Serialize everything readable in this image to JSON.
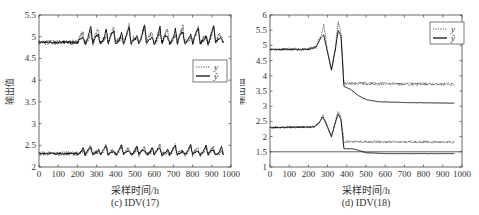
{
  "chart_data": [
    {
      "id": "c",
      "type": "line",
      "title": "",
      "caption": "(c) IDV(17)",
      "xlabel": "采样时间/h",
      "ylabel": "输出值",
      "xlim": [
        0,
        1000
      ],
      "ylim": [
        2,
        5.5
      ],
      "xticks": [
        0,
        100,
        200,
        300,
        400,
        500,
        600,
        700,
        800,
        900,
        1000
      ],
      "yticks": [
        2,
        2.5,
        3,
        3.5,
        4,
        4.5,
        5,
        5.5
      ],
      "ytick_labels": [
        "2",
        "2.5",
        "3",
        "3.5",
        "4",
        "4.5",
        "5",
        "5.5"
      ],
      "grid": false,
      "legend": {
        "position": "upper-right-inside",
        "entries": [
          "y",
          "ŷ"
        ]
      },
      "series": [
        {
          "name": "y",
          "style": "dotted",
          "group": "upper",
          "baseline": 4.87,
          "noise": 0.06,
          "description": "noisy around 4.85-4.9 for t<200, then periodic sawtooth spikes up to ~5.2-5.3 every ~40h until t≈960"
        },
        {
          "name": "ŷ",
          "style": "solid",
          "group": "upper",
          "baseline": 4.87,
          "noise": 0.03,
          "description": "tracks y with sawtooth peaks ~5.2"
        },
        {
          "name": "y",
          "style": "dotted",
          "group": "lower",
          "baseline": 2.31,
          "noise": 0.05,
          "description": "noisy around 2.3 for t<200, then periodic spikes up to ~2.5 every ~40h"
        },
        {
          "name": "ŷ",
          "style": "solid",
          "group": "lower",
          "baseline": 2.31,
          "noise": 0.02,
          "description": "tracks y with spikes ~2.5"
        }
      ],
      "spike_start": 200,
      "spike_period": 40,
      "t_end": 960,
      "upper_spike_peak": 5.22,
      "lower_spike_peak": 2.5
    },
    {
      "id": "d",
      "type": "line",
      "title": "",
      "caption": "(d) IDV(18)",
      "xlabel": "采样时间/h",
      "ylabel": "输出值",
      "xlim": [
        0,
        1000
      ],
      "ylim": [
        1,
        6
      ],
      "xticks": [
        0,
        100,
        200,
        300,
        400,
        500,
        600,
        700,
        800,
        900,
        1000
      ],
      "yticks": [
        1,
        1.5,
        2,
        2.5,
        3,
        3.5,
        4,
        4.5,
        5,
        5.5,
        6
      ],
      "ytick_labels": [
        "1",
        "1.5",
        "2",
        "2.5",
        "3",
        "3.5",
        "4",
        "4.5",
        "5",
        "5.5",
        "6"
      ],
      "grid": false,
      "legend": {
        "position": "upper-right-inside",
        "entries": [
          "y",
          "ŷ"
        ]
      },
      "reference_line": {
        "y": 1.5,
        "style": "solid-thin"
      },
      "series": [
        {
          "name": "y",
          "style": "dotted",
          "group": "upper",
          "points": [
            [
              0,
              4.87
            ],
            [
              200,
              4.87
            ],
            [
              240,
              4.95
            ],
            [
              265,
              5.3
            ],
            [
              280,
              5.7
            ],
            [
              295,
              5.0
            ],
            [
              320,
              4.15
            ],
            [
              340,
              4.9
            ],
            [
              355,
              5.8
            ],
            [
              370,
              5.4
            ],
            [
              385,
              3.75
            ],
            [
              960,
              3.72
            ]
          ],
          "noise_after": 0.05
        },
        {
          "name": "ŷ",
          "style": "solid",
          "group": "upper",
          "points": [
            [
              0,
              4.87
            ],
            [
              200,
              4.87
            ],
            [
              240,
              4.95
            ],
            [
              265,
              5.25
            ],
            [
              280,
              5.35
            ],
            [
              295,
              4.9
            ],
            [
              320,
              4.2
            ],
            [
              340,
              4.85
            ],
            [
              355,
              5.5
            ],
            [
              370,
              5.3
            ],
            [
              385,
              3.65
            ],
            [
              420,
              3.55
            ],
            [
              460,
              3.35
            ],
            [
              500,
              3.22
            ],
            [
              560,
              3.15
            ],
            [
              700,
              3.12
            ],
            [
              960,
              3.1
            ]
          ]
        },
        {
          "name": "y",
          "style": "dotted",
          "group": "lower",
          "points": [
            [
              0,
              2.3
            ],
            [
              230,
              2.32
            ],
            [
              255,
              2.45
            ],
            [
              275,
              2.7
            ],
            [
              290,
              2.5
            ],
            [
              320,
              2.0
            ],
            [
              340,
              2.5
            ],
            [
              355,
              2.85
            ],
            [
              370,
              2.6
            ],
            [
              385,
              1.83
            ],
            [
              960,
              1.82
            ]
          ],
          "noise_after": 0.04
        },
        {
          "name": "ŷ",
          "style": "solid",
          "group": "lower",
          "points": [
            [
              0,
              2.3
            ],
            [
              230,
              2.32
            ],
            [
              255,
              2.45
            ],
            [
              275,
              2.65
            ],
            [
              290,
              2.45
            ],
            [
              320,
              2.0
            ],
            [
              340,
              2.45
            ],
            [
              355,
              2.75
            ],
            [
              370,
              2.55
            ],
            [
              385,
              1.6
            ],
            [
              430,
              1.6
            ],
            [
              460,
              1.55
            ],
            [
              500,
              1.47
            ],
            [
              600,
              1.44
            ],
            [
              960,
              1.44
            ]
          ]
        }
      ]
    }
  ]
}
